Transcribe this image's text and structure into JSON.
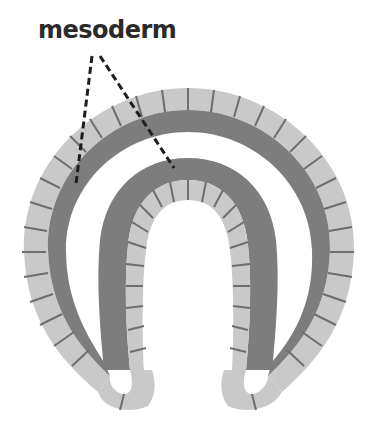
{
  "diagram": {
    "labels": [
      {
        "text": "mesoderm",
        "points_to": [
          "outer dark band",
          "inner dark band"
        ]
      }
    ],
    "colors": {
      "ectoderm_cells": "#c9c9c9",
      "mesoderm": "#7d7d7d",
      "cell_divider": "#6e6e6e",
      "leader_line": "#1e1e1e",
      "label_text": "#2a2a2a",
      "background": "#ffffff"
    }
  }
}
